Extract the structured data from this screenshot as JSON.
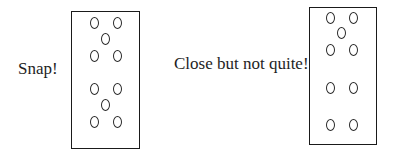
{
  "labels": {
    "left": "Snap!",
    "right": "Close but not quite!"
  },
  "colors": {
    "stroke": "#1a1a1a",
    "text": "#1e1e1e",
    "background": "#ffffff"
  },
  "panels": [
    {
      "name": "snap",
      "box": {
        "x": 71,
        "y": 11,
        "w": 69,
        "h": 138
      },
      "rings": [
        {
          "cx": 94,
          "cy": 23
        },
        {
          "cx": 117,
          "cy": 23
        },
        {
          "cx": 105,
          "cy": 39
        },
        {
          "cx": 94,
          "cy": 56
        },
        {
          "cx": 117,
          "cy": 56
        },
        {
          "cx": 94,
          "cy": 89
        },
        {
          "cx": 117,
          "cy": 89
        },
        {
          "cx": 105,
          "cy": 105
        },
        {
          "cx": 94,
          "cy": 122
        },
        {
          "cx": 117,
          "cy": 122
        }
      ]
    },
    {
      "name": "close-but-not-quite",
      "box": {
        "x": 309,
        "y": 7,
        "w": 68,
        "h": 138
      },
      "rings": [
        {
          "cx": 330,
          "cy": 18
        },
        {
          "cx": 353,
          "cy": 18
        },
        {
          "cx": 341,
          "cy": 33
        },
        {
          "cx": 330,
          "cy": 50
        },
        {
          "cx": 353,
          "cy": 50
        },
        {
          "cx": 330,
          "cy": 88
        },
        {
          "cx": 353,
          "cy": 88
        },
        {
          "cx": 330,
          "cy": 125
        },
        {
          "cx": 353,
          "cy": 125
        }
      ]
    }
  ]
}
